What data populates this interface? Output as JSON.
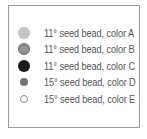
{
  "legend": {
    "items": [
      {
        "label": "11° seed bead, color A",
        "fill": "#c4c4c4",
        "stroke": "#c4c4c4",
        "size": "large"
      },
      {
        "label": "11° seed bead, color B",
        "fill": "#8f8f8f",
        "stroke": "#6a6a6a",
        "size": "large"
      },
      {
        "label": "11° seed bead, color C",
        "fill": "#1a1a1a",
        "stroke": "#1a1a1a",
        "size": "large"
      },
      {
        "label": "15° seed bead, color D",
        "fill": "#707070",
        "stroke": "#707070",
        "size": "small"
      },
      {
        "label": "15° seed bead, color E",
        "fill": "#ffffff",
        "stroke": "#8a8a8a",
        "size": "small"
      }
    ]
  }
}
